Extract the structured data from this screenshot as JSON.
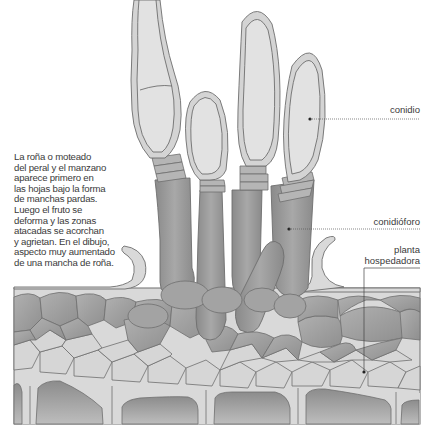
{
  "description": {
    "lines": [
      "La roña o moteado",
      "del peral y el manzano",
      "aparece primero en",
      "las hojas bajo la forma",
      "de manchas pardas.",
      "Luego el fruto se",
      "deforma y las zonas",
      "atacadas se acorchan",
      "y agrietan. En el dibujo,",
      "aspecto muy aumentado",
      "de una mancha de roña."
    ]
  },
  "labels": {
    "conidio": "conidio",
    "conidioforo": "conidióforo",
    "planta_line1": "planta",
    "planta_line2": "hospedadora"
  },
  "colors": {
    "conidium_fill": "#d9d9d9",
    "conidium_inner": "#e4e4e4",
    "outline": "#6e6e6e",
    "conidiophore_fill": "#8e8e8e",
    "cell_dark": "#9a9a9a",
    "cell_light": "#d6d6d6",
    "background": "#ffffff",
    "text": "#3a3a3a"
  }
}
